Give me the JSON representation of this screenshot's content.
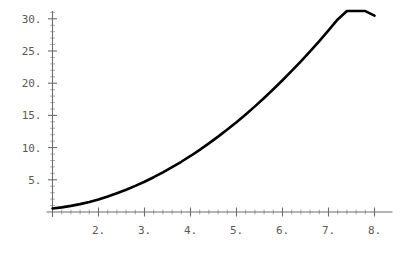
{
  "chart_data": {
    "type": "line",
    "title": "",
    "subtitle": "",
    "xlabel": "",
    "ylabel": "",
    "xlim": [
      0.85,
      8.1
    ],
    "ylim": [
      0.0,
      31.5
    ],
    "grid": false,
    "legend": false,
    "legend_position": "none",
    "x_tick_labels": [
      "2.",
      "3.",
      "4.",
      "5.",
      "6.",
      "7.",
      "8."
    ],
    "x_tick_values": [
      2,
      3,
      4,
      5,
      6,
      7,
      8
    ],
    "y_tick_labels": [
      "5.",
      "10.",
      "15.",
      "20.",
      "25.",
      "30."
    ],
    "y_tick_values": [
      5,
      10,
      15,
      20,
      25,
      30
    ],
    "x_minor_count": 4,
    "y_minor_count": 4,
    "series": [
      {
        "name": "curve",
        "color": "#000000",
        "line_width": 2.6,
        "x": [
          1.0,
          1.2,
          1.4,
          1.6,
          1.8,
          2.0,
          2.2,
          2.4,
          2.6,
          2.8,
          3.0,
          3.2,
          3.4,
          3.6,
          3.8,
          4.0,
          4.2,
          4.4,
          4.6,
          4.8,
          5.0,
          5.2,
          5.4,
          5.6,
          5.8,
          6.0,
          6.2,
          6.4,
          6.6,
          6.8,
          7.0,
          7.2,
          7.4,
          7.6,
          7.8,
          8.0
        ],
        "y": [
          0.55,
          0.72,
          0.95,
          1.22,
          1.55,
          1.95,
          2.4,
          2.9,
          3.45,
          4.05,
          4.7,
          5.4,
          6.15,
          6.95,
          7.8,
          8.7,
          9.65,
          10.65,
          11.7,
          12.8,
          13.95,
          15.15,
          16.4,
          17.7,
          19.05,
          20.45,
          21.9,
          23.4,
          24.95,
          26.55,
          28.2,
          29.9,
          31.65,
          33.45,
          35.3,
          30.5
        ]
      }
    ],
    "axis_color": "#6e6e6e",
    "tick_color": "#6e6e6e",
    "background": "#ffffff"
  },
  "axes": {
    "y_axis_name": "y-axis",
    "x_axis_name": "x-axis"
  }
}
